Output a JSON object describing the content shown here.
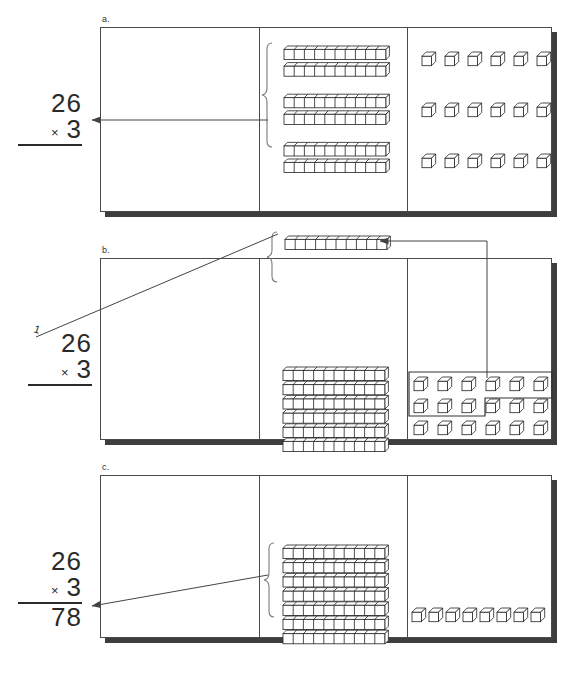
{
  "figure": {
    "caption": "",
    "ink_color": "#333333",
    "shadow_color": "#3e3e3e",
    "paper_color": "#ffffff"
  },
  "panels": [
    {
      "label": "a.",
      "name": "panel-a",
      "math": {
        "carry": "",
        "top_number": "26",
        "operator": "×",
        "bottom_number": "3",
        "product": ""
      },
      "tens_groups": 3,
      "rods_per_group": 2,
      "units_per_rod": 10,
      "ones_rows": 3,
      "ones_per_row": 6,
      "total_tens": 6,
      "total_ones": 18,
      "brace": true,
      "arrow_description": "arrow from blocks to the 26 x 3 expression"
    },
    {
      "label": "b.",
      "name": "panel-b",
      "math": {
        "carry": "1",
        "top_number": "26",
        "operator": "×",
        "bottom_number": "3",
        "product": ""
      },
      "regrouped_rod_units": 10,
      "tens_rows": 6,
      "units_per_rod": 10,
      "ones_rows": 3,
      "ones_per_row": 6,
      "total_tens": 6,
      "total_ones": 18,
      "regroup_box_count": 10,
      "brace": true,
      "arrow_description": "arrow from the ten regrouped ones up to the new rod, and a line from the rod to the carried 1"
    },
    {
      "label": "c.",
      "name": "panel-c",
      "math": {
        "carry": "",
        "top_number": "26",
        "operator": "×",
        "bottom_number": "3",
        "product": "78"
      },
      "tens_rows": 7,
      "units_per_rod": 10,
      "ones_rows": 1,
      "ones_per_row": 8,
      "total_tens": 7,
      "total_ones": 8,
      "brace": true,
      "arrow_description": "arrow from blocks to the product 78"
    }
  ]
}
